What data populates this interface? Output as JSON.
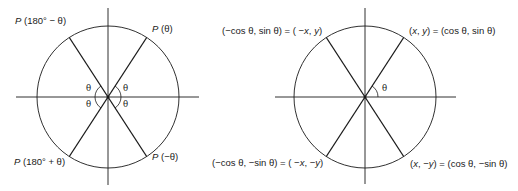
{
  "left_diagram": {
    "labels": {
      "top_left": {
        "p": "P",
        "arg": " (180° − θ)"
      },
      "top_right": {
        "p": "P",
        "arg": " (θ)"
      },
      "bottom_left": {
        "p": "P",
        "arg": " (180° + θ)"
      },
      "bottom_right": {
        "p": "P",
        "arg": " (−θ)"
      }
    },
    "angle_labels": [
      "θ",
      "θ",
      "θ",
      "θ"
    ]
  },
  "right_diagram": {
    "labels": {
      "top_left": {
        "pre": "(−cos θ, sin θ) = ( −",
        "x": "x",
        "mid": ", ",
        "y": "y",
        "post": ")"
      },
      "top_right": {
        "pre": "(",
        "x": "x",
        "mid": ", ",
        "y": "y",
        "post": ") = (cos θ, sin θ)"
      },
      "bottom_left": {
        "pre": "(−cos θ, −sin θ) = ( −",
        "x": "x",
        "mid": ", −",
        "y": "y",
        "post": ")"
      },
      "bottom_right": {
        "pre": "(",
        "x": "x",
        "mid": ", −",
        "y": "y",
        "post": ") = (cos θ, −sin θ)"
      }
    },
    "angle_label": "θ"
  },
  "geometry": {
    "radius": 71,
    "theta_degrees": 57,
    "stroke_color": "#1a1a1a"
  }
}
